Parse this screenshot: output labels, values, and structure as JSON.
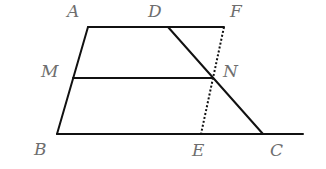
{
  "diagram": {
    "type": "geometry",
    "points": {
      "A": {
        "label": "A",
        "x": 88,
        "y": 27
      },
      "D": {
        "label": "D",
        "x": 168,
        "y": 27
      },
      "F": {
        "label": "F",
        "x": 224,
        "y": 27
      },
      "M": {
        "label": "M",
        "x": 73,
        "y": 78
      },
      "N": {
        "label": "N",
        "x": 213,
        "y": 78
      },
      "B": {
        "label": "B",
        "x": 57,
        "y": 134
      },
      "E": {
        "label": "E",
        "x": 201,
        "y": 134
      },
      "C": {
        "label": "C",
        "x": 263,
        "y": 134
      }
    },
    "segments": [
      {
        "from": "A",
        "to": "F",
        "style": "solid"
      },
      {
        "from": "A",
        "to": "B",
        "style": "solid"
      },
      {
        "from": "M",
        "to": "N",
        "style": "solid"
      },
      {
        "from": "B",
        "to": "C",
        "style": "solid",
        "extends_to_x": 303
      },
      {
        "from": "D",
        "to": "C",
        "style": "solid"
      },
      {
        "from": "F",
        "to": "E",
        "style": "dotted"
      }
    ]
  }
}
